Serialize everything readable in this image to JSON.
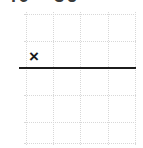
{
  "worksheet": {
    "title_clipped": "40 - 36",
    "operator_symbol": "×",
    "operator_name": "multiplication-sign",
    "answer_line_present": true,
    "background_color": "#ffffff",
    "ink_color": "#1c1c1c",
    "gridline_color": "#d8d8d8"
  },
  "grid": {
    "style": "dotted",
    "vertical_positions": [
      26,
      53,
      80,
      108,
      135
    ],
    "horizontal_positions": [
      14,
      41,
      68,
      95,
      122,
      143
    ],
    "columns": 4,
    "rows": 5
  },
  "answer_rule": {
    "x_start": 19,
    "x_end": 136,
    "y": 67,
    "thickness": 2,
    "color": "#1c1c1c"
  }
}
